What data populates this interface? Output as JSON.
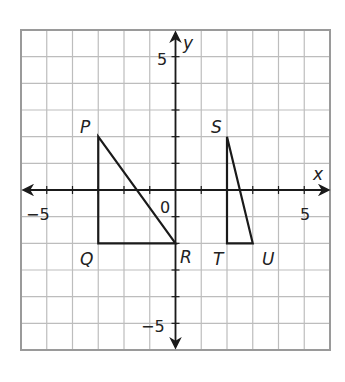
{
  "figure": {
    "type": "coordinate-plane",
    "grid": {
      "xmin": -6,
      "xmax": 6,
      "ymin": -6,
      "ymax": 6,
      "step": 1
    },
    "axes": {
      "x_label": "x",
      "y_label": "y",
      "origin_label": "0",
      "x_ticks_labeled": [
        {
          "value": -5,
          "text": "−5"
        },
        {
          "value": 5,
          "text": "5"
        }
      ],
      "y_ticks_labeled": [
        {
          "value": 5,
          "text": "5"
        },
        {
          "value": -5,
          "text": "−5"
        }
      ]
    },
    "triangles": [
      {
        "name": "PQR",
        "vertices": [
          {
            "label": "P",
            "x": -3,
            "y": 2
          },
          {
            "label": "Q",
            "x": -3,
            "y": -2
          },
          {
            "label": "R",
            "x": 0,
            "y": -2
          }
        ]
      },
      {
        "name": "STU",
        "vertices": [
          {
            "label": "S",
            "x": 2,
            "y": 2
          },
          {
            "label": "T",
            "x": 2,
            "y": -2
          },
          {
            "label": "U",
            "x": 3,
            "y": -2
          }
        ]
      }
    ],
    "colors": {
      "grid": "#b8b8b8",
      "border": "#9a9a9a",
      "axis": "#1a1a1a",
      "shape": "#1a1a1a"
    }
  }
}
